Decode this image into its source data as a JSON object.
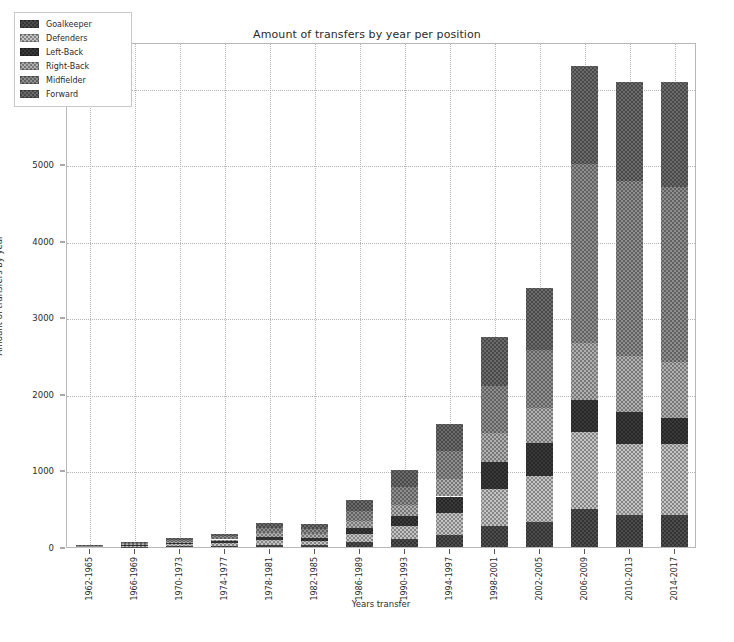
{
  "chart_data": {
    "type": "bar",
    "subtype": "stacked-vertical",
    "title": "Amount of transfers by year per position",
    "xlabel": "Years transfer",
    "ylabel": "Amount of transfers by year",
    "ylim": [
      0,
      6600
    ],
    "yticks": [
      0,
      1000,
      2000,
      3000,
      4000,
      5000,
      6000
    ],
    "ytick_labels": [
      "0",
      "1000",
      "2000",
      "3000",
      "4000",
      "5000",
      "6000"
    ],
    "grid": true,
    "grid_style": "dotted",
    "legend_position": "upper left",
    "categories": [
      "1962-1965",
      "1966-1969",
      "1970-1973",
      "1974-1977",
      "1978-1981",
      "1982-1985",
      "1986-1989",
      "1990-1993",
      "1994-1997",
      "1998-2001",
      "2002-2005",
      "2006-2009",
      "2010-2013",
      "2014-2017"
    ],
    "series": [
      {
        "name": "Goalkeeper",
        "color": "#4d4d4d",
        "hatch": "xx",
        "values": [
          2,
          6,
          12,
          18,
          32,
          30,
          60,
          100,
          160,
          270,
          330,
          500,
          420,
          420
        ]
      },
      {
        "name": "Defenders",
        "color": "#c4c4c4",
        "hatch": "xx",
        "values": [
          4,
          11,
          22,
          32,
          58,
          54,
          110,
          180,
          290,
          490,
          600,
          1000,
          920,
          920
        ]
      },
      {
        "name": "Left-Back",
        "color": "#3a3a3a",
        "hatch": "xx",
        "values": [
          3,
          8,
          16,
          23,
          42,
          40,
          80,
          130,
          210,
          350,
          430,
          420,
          420,
          340
        ]
      },
      {
        "name": "Right-Back",
        "color": "#b0b0b0",
        "hatch": "xx",
        "values": [
          3,
          9,
          17,
          25,
          45,
          42,
          85,
          140,
          225,
          380,
          460,
          740,
          730,
          740
        ]
      },
      {
        "name": "Midfielder",
        "color": "#8f8f8f",
        "hatch": "xx",
        "values": [
          5,
          14,
          28,
          40,
          72,
          68,
          140,
          230,
          370,
          620,
          760,
          2350,
          2290,
          2290
        ]
      },
      {
        "name": "Forward",
        "color": "#6b6b6b",
        "hatch": "xx",
        "values": [
          3,
          12,
          25,
          37,
          71,
          66,
          135,
          220,
          355,
          640,
          800,
          1270,
          1300,
          1370
        ]
      }
    ],
    "totals": [
      20,
      60,
      120,
      175,
      320,
      300,
      610,
      1000,
      1610,
      2750,
      3380,
      6280,
      6080,
      6080
    ]
  }
}
